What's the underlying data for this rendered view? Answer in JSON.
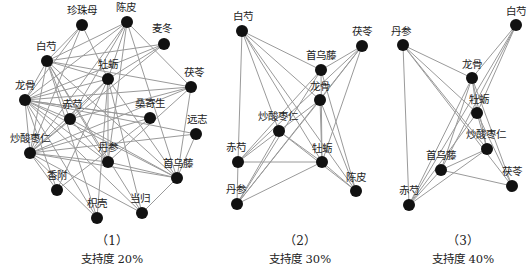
{
  "panels": [
    {
      "caption_index": "（1）",
      "caption_text": "支持度 20%",
      "caption_x": 112,
      "nodes": [
        {
          "id": "珍珠母",
          "x": 82,
          "y": 25,
          "lx": 82,
          "ly": 14
        },
        {
          "id": "陈皮",
          "x": 127,
          "y": 22,
          "lx": 126,
          "ly": 11
        },
        {
          "id": "麦冬",
          "x": 164,
          "y": 44,
          "lx": 162,
          "ly": 32
        },
        {
          "id": "白芍",
          "x": 47,
          "y": 61,
          "lx": 46,
          "ly": 50
        },
        {
          "id": "牡蛎",
          "x": 108,
          "y": 79,
          "lx": 108,
          "ly": 68
        },
        {
          "id": "茯苓",
          "x": 191,
          "y": 87,
          "lx": 194,
          "ly": 76
        },
        {
          "id": "龙骨",
          "x": 25,
          "y": 100,
          "lx": 25,
          "ly": 89
        },
        {
          "id": "赤芍",
          "x": 70,
          "y": 119,
          "lx": 72,
          "ly": 108
        },
        {
          "id": "桑寄生",
          "x": 150,
          "y": 118,
          "lx": 150,
          "ly": 107
        },
        {
          "id": "远志",
          "x": 196,
          "y": 134,
          "lx": 197,
          "ly": 123
        },
        {
          "id": "炒酸枣仁",
          "x": 30,
          "y": 153,
          "lx": 30,
          "ly": 142
        },
        {
          "id": "丹参",
          "x": 108,
          "y": 162,
          "lx": 108,
          "ly": 151
        },
        {
          "id": "首乌藤",
          "x": 177,
          "y": 178,
          "lx": 178,
          "ly": 167
        },
        {
          "id": "香附",
          "x": 57,
          "y": 190,
          "lx": 57,
          "ly": 179
        },
        {
          "id": "枳壳",
          "x": 97,
          "y": 218,
          "lx": 97,
          "ly": 207
        },
        {
          "id": "当归",
          "x": 142,
          "y": 213,
          "lx": 140,
          "ly": 202
        }
      ],
      "edges": [
        [
          "珍珠母",
          "白芍"
        ],
        [
          "珍珠母",
          "龙骨"
        ],
        [
          "珍珠母",
          "牡蛎"
        ],
        [
          "珍珠母",
          "炒酸枣仁"
        ],
        [
          "陈皮",
          "白芍"
        ],
        [
          "陈皮",
          "龙骨"
        ],
        [
          "陈皮",
          "牡蛎"
        ],
        [
          "陈皮",
          "炒酸枣仁"
        ],
        [
          "陈皮",
          "首乌藤"
        ],
        [
          "陈皮",
          "赤芍"
        ],
        [
          "陈皮",
          "茯苓"
        ],
        [
          "陈皮",
          "丹参"
        ],
        [
          "麦冬",
          "龙骨"
        ],
        [
          "麦冬",
          "白芍"
        ],
        [
          "麦冬",
          "炒酸枣仁"
        ],
        [
          "麦冬",
          "牡蛎"
        ],
        [
          "白芍",
          "牡蛎"
        ],
        [
          "白芍",
          "茯苓"
        ],
        [
          "白芍",
          "龙骨"
        ],
        [
          "白芍",
          "炒酸枣仁"
        ],
        [
          "白芍",
          "首乌藤"
        ],
        [
          "白芍",
          "丹参"
        ],
        [
          "白芍",
          "赤芍"
        ],
        [
          "白芍",
          "枳壳"
        ],
        [
          "白芍",
          "当归"
        ],
        [
          "牡蛎",
          "龙骨"
        ],
        [
          "牡蛎",
          "炒酸枣仁"
        ],
        [
          "牡蛎",
          "丹参"
        ],
        [
          "牡蛎",
          "首乌藤"
        ],
        [
          "牡蛎",
          "赤芍"
        ],
        [
          "牡蛎",
          "枳壳"
        ],
        [
          "牡蛎",
          "当归"
        ],
        [
          "牡蛎",
          "香附"
        ],
        [
          "茯苓",
          "龙骨"
        ],
        [
          "茯苓",
          "炒酸枣仁"
        ],
        [
          "茯苓",
          "首乌藤"
        ],
        [
          "茯苓",
          "丹参"
        ],
        [
          "茯苓",
          "赤芍"
        ],
        [
          "龙骨",
          "炒酸枣仁"
        ],
        [
          "龙骨",
          "首乌藤"
        ],
        [
          "龙骨",
          "丹参"
        ],
        [
          "龙骨",
          "赤芍"
        ],
        [
          "龙骨",
          "桑寄生"
        ],
        [
          "龙骨",
          "远志"
        ],
        [
          "龙骨",
          "香附"
        ],
        [
          "龙骨",
          "枳壳"
        ],
        [
          "龙骨",
          "当归"
        ],
        [
          "赤芍",
          "炒酸枣仁"
        ],
        [
          "赤芍",
          "首乌藤"
        ],
        [
          "赤芍",
          "丹参"
        ],
        [
          "桑寄生",
          "炒酸枣仁"
        ],
        [
          "桑寄生",
          "龙骨"
        ],
        [
          "桑寄生",
          "香附"
        ],
        [
          "远志",
          "炒酸枣仁"
        ],
        [
          "远志",
          "首乌藤"
        ],
        [
          "炒酸枣仁",
          "首乌藤"
        ],
        [
          "炒酸枣仁",
          "丹参"
        ],
        [
          "炒酸枣仁",
          "香附"
        ],
        [
          "炒酸枣仁",
          "枳壳"
        ],
        [
          "炒酸枣仁",
          "当归"
        ],
        [
          "丹参",
          "首乌藤"
        ],
        [
          "首乌藤",
          "当归"
        ]
      ]
    },
    {
      "caption_index": "（2）",
      "caption_text": "支持度 30%",
      "caption_x": 300,
      "nodes": [
        {
          "id": "白芍",
          "x": 242,
          "y": 31,
          "lx": 243,
          "ly": 20
        },
        {
          "id": "茯苓",
          "x": 362,
          "y": 46,
          "lx": 362,
          "ly": 35
        },
        {
          "id": "首乌藤",
          "x": 321,
          "y": 70,
          "lx": 321,
          "ly": 59
        },
        {
          "id": "龙骨",
          "x": 320,
          "y": 100,
          "lx": 320,
          "ly": 90
        },
        {
          "id": "炒酸枣仁",
          "x": 279,
          "y": 131,
          "lx": 278,
          "ly": 120
        },
        {
          "id": "赤芍",
          "x": 238,
          "y": 162,
          "lx": 236,
          "ly": 151
        },
        {
          "id": "牡蛎",
          "x": 322,
          "y": 162,
          "lx": 322,
          "ly": 152
        },
        {
          "id": "丹参",
          "x": 237,
          "y": 204,
          "lx": 236,
          "ly": 193
        },
        {
          "id": "陈皮",
          "x": 356,
          "y": 191,
          "lx": 356,
          "ly": 181
        }
      ],
      "edges": [
        [
          "白芍",
          "首乌藤"
        ],
        [
          "白芍",
          "龙骨"
        ],
        [
          "白芍",
          "牡蛎"
        ],
        [
          "白芍",
          "陈皮"
        ],
        [
          "白芍",
          "赤芍"
        ],
        [
          "白芍",
          "炒酸枣仁"
        ],
        [
          "茯苓",
          "首乌藤"
        ],
        [
          "茯苓",
          "龙骨"
        ],
        [
          "茯苓",
          "牡蛎"
        ],
        [
          "茯苓",
          "赤芍"
        ],
        [
          "茯苓",
          "丹参"
        ],
        [
          "首乌藤",
          "牡蛎"
        ],
        [
          "首乌藤",
          "丹参"
        ],
        [
          "首乌藤",
          "赤芍"
        ],
        [
          "首乌藤",
          "陈皮"
        ],
        [
          "龙骨",
          "牡蛎"
        ],
        [
          "龙骨",
          "丹参"
        ],
        [
          "龙骨",
          "炒酸枣仁"
        ],
        [
          "龙骨",
          "陈皮"
        ],
        [
          "炒酸枣仁",
          "赤芍"
        ],
        [
          "炒酸枣仁",
          "丹参"
        ],
        [
          "炒酸枣仁",
          "牡蛎"
        ],
        [
          "炒酸枣仁",
          "陈皮"
        ],
        [
          "赤芍",
          "牡蛎"
        ],
        [
          "赤芍",
          "丹参"
        ],
        [
          "牡蛎",
          "丹参"
        ],
        [
          "牡蛎",
          "陈皮"
        ]
      ]
    },
    {
      "caption_index": "（3）",
      "caption_text": "支持度 40%",
      "caption_x": 463,
      "nodes": [
        {
          "id": "白芍",
          "x": 516,
          "y": 25,
          "lx": 516,
          "ly": 15
        },
        {
          "id": "丹参",
          "x": 403,
          "y": 45,
          "lx": 401,
          "ly": 35
        },
        {
          "id": "龙骨",
          "x": 472,
          "y": 78,
          "lx": 472,
          "ly": 68
        },
        {
          "id": "牡蛎",
          "x": 477,
          "y": 113,
          "lx": 479,
          "ly": 103
        },
        {
          "id": "炒酸枣仁",
          "x": 487,
          "y": 149,
          "lx": 486,
          "ly": 138
        },
        {
          "id": "首乌藤",
          "x": 441,
          "y": 170,
          "lx": 441,
          "ly": 159
        },
        {
          "id": "茯苓",
          "x": 512,
          "y": 186,
          "lx": 512,
          "ly": 175
        },
        {
          "id": "赤芍",
          "x": 409,
          "y": 205,
          "lx": 409,
          "ly": 194
        }
      ],
      "edges": [
        [
          "白芍",
          "龙骨"
        ],
        [
          "白芍",
          "首乌藤"
        ],
        [
          "白芍",
          "赤芍"
        ],
        [
          "白芍",
          "牡蛎"
        ],
        [
          "丹参",
          "龙骨"
        ],
        [
          "丹参",
          "牡蛎"
        ],
        [
          "丹参",
          "炒酸枣仁"
        ],
        [
          "丹参",
          "茯苓"
        ],
        [
          "丹参",
          "赤芍"
        ],
        [
          "龙骨",
          "牡蛎"
        ],
        [
          "龙骨",
          "炒酸枣仁"
        ],
        [
          "龙骨",
          "首乌藤"
        ],
        [
          "龙骨",
          "赤芍"
        ],
        [
          "龙骨",
          "茯苓"
        ],
        [
          "牡蛎",
          "炒酸枣仁"
        ],
        [
          "牡蛎",
          "赤芍"
        ],
        [
          "牡蛎",
          "茯苓"
        ],
        [
          "炒酸枣仁",
          "赤芍"
        ],
        [
          "炒酸枣仁",
          "首乌藤"
        ],
        [
          "首乌藤",
          "茯苓"
        ],
        [
          "首乌藤",
          "赤芍"
        ]
      ]
    }
  ],
  "style": {
    "edge_color": "#9a9a9a",
    "node_color": "#111111",
    "node_radius": 6
  }
}
